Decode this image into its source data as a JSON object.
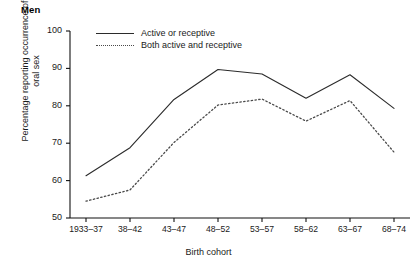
{
  "panel": {
    "title": "Men"
  },
  "chart_data": {
    "type": "line",
    "title": "Men",
    "xlabel": "Birth cohort",
    "ylabel": "Percentage reporting occurrence of\noral sex",
    "ylabel_line1": "Percentage reporting occurrence of",
    "ylabel_line2": "oral sex",
    "categories": [
      "1933–37",
      "38–42",
      "43–47",
      "48–52",
      "53–57",
      "58–62",
      "63–67",
      "68–74"
    ],
    "ylim": [
      50,
      100
    ],
    "yticks": [
      50,
      60,
      70,
      80,
      90,
      100
    ],
    "ytick_labels": [
      "50",
      "60",
      "70",
      "80",
      "90",
      "100"
    ],
    "grid": false,
    "legend_position": "top-left inside",
    "series": [
      {
        "name": "Active or receptive",
        "style": "solid",
        "color": "#2b2b2b",
        "values": [
          61.3,
          68.8,
          81.7,
          89.7,
          88.5,
          82.0,
          88.3,
          79.3
        ]
      },
      {
        "name": "Both active and receptive",
        "style": "dotted",
        "color": "#4a4a4a",
        "values": [
          54.5,
          57.5,
          70.2,
          80.2,
          81.8,
          75.9,
          81.4,
          67.6
        ]
      }
    ]
  }
}
